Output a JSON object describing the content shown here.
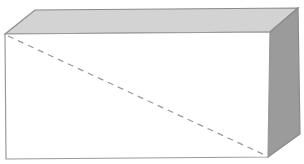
{
  "figure": {
    "colors": {
      "background": "#ffffff",
      "front_face": "#ffffff",
      "top_face": "#d3d3d3",
      "right_face": "#9b9b9b",
      "edge": "#8a8a8a",
      "diagonal": "#9a9a9a"
    },
    "labels": []
  }
}
